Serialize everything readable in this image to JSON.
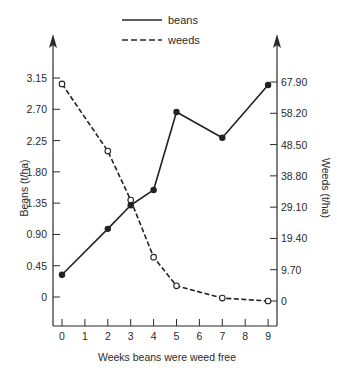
{
  "chart_data": {
    "type": "line",
    "title": "",
    "xlabel": "Weeks beans were weed free",
    "ylabel_left": "Beans (t/ha)",
    "ylabel_right": "Weeds (t/ha)",
    "x": [
      0,
      2,
      3,
      4,
      5,
      7,
      9
    ],
    "x_ticks": [
      "0",
      "1",
      "2",
      "3",
      "4",
      "5",
      "6",
      "7",
      "8",
      "9"
    ],
    "y_left_ticks": [
      "0",
      "0.45",
      "0.90",
      "1.35",
      "1.80",
      "2.25",
      "2.70",
      "3.15"
    ],
    "y_right_ticks": [
      "0",
      "9.70",
      "19.40",
      "29.10",
      "38.80",
      "48.50",
      "58.20",
      "67.90"
    ],
    "ylim_left": [
      0,
      3.15
    ],
    "ylim_right": [
      0,
      67.9
    ],
    "xlim": [
      0,
      9
    ],
    "grid": false,
    "legend_position": "top-center",
    "series": [
      {
        "name": "beans",
        "axis": "left",
        "style": "solid",
        "marker": "filled-circle",
        "values": [
          0.32,
          0.98,
          1.32,
          1.54,
          2.66,
          2.29,
          3.05
        ]
      },
      {
        "name": "weeds",
        "axis": "right",
        "style": "dashed",
        "marker": "open-circle",
        "values": [
          67.3,
          46.5,
          31.3,
          13.6,
          4.7,
          0.9,
          0.0
        ]
      }
    ]
  },
  "legend": {
    "beans_label": "beans",
    "weeds_label": "weeds"
  },
  "axes": {
    "x_title": "Weeks beans were weed free",
    "left_title": "Beans (t/ha)",
    "right_title": "Weeds (t/ha)"
  }
}
